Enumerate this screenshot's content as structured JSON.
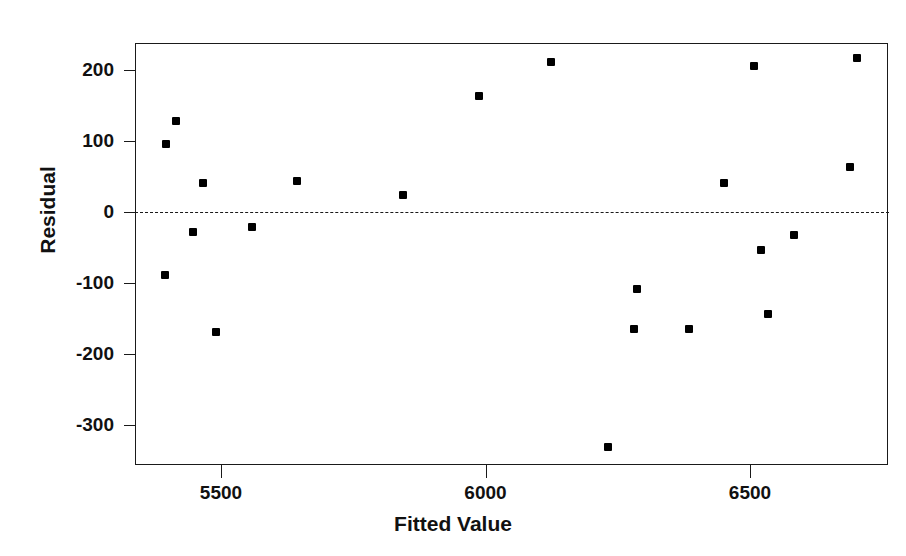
{
  "chart_data": {
    "type": "scatter",
    "title": "",
    "xlabel": "Fitted Value",
    "ylabel": "Residual",
    "xlim": [
      5329,
      6753
    ],
    "ylim": [
      -355,
      238
    ],
    "xticks": [
      5500,
      6000,
      6500
    ],
    "yticks": [
      200,
      100,
      0,
      -100,
      -200,
      -300
    ],
    "xtick_labels": [
      "5500",
      "6000",
      "6500"
    ],
    "ytick_labels": [
      "200",
      "100",
      "0",
      "-100",
      "-200",
      "-300"
    ],
    "grid": false,
    "legend": null,
    "reference_line": {
      "orientation": "horizontal",
      "value": 0,
      "style": "dashed",
      "color": "#1a1a1a"
    },
    "marker": {
      "shape": "square",
      "color": "#000000",
      "size": 8
    },
    "x": [
      5414,
      5396,
      5466,
      5447,
      5559,
      5394,
      5491,
      5644,
      5844,
      5988,
      6124,
      6287,
      6281,
      6385,
      6232,
      6451,
      6508,
      6521,
      6534,
      6583,
      6689,
      6702
    ],
    "y": [
      128,
      96,
      41,
      -28,
      -21,
      -89,
      -169,
      44,
      24,
      163,
      211,
      -108,
      -165,
      -165,
      -331,
      41,
      206,
      -53,
      -144,
      -32,
      63,
      217
    ],
    "points": [
      {
        "x": 5414,
        "y": 128
      },
      {
        "x": 5396,
        "y": 96
      },
      {
        "x": 5466,
        "y": 41
      },
      {
        "x": 5447,
        "y": -28
      },
      {
        "x": 5559,
        "y": -21
      },
      {
        "x": 5394,
        "y": -89
      },
      {
        "x": 5491,
        "y": -169
      },
      {
        "x": 5644,
        "y": 44
      },
      {
        "x": 5844,
        "y": 24
      },
      {
        "x": 5988,
        "y": 163
      },
      {
        "x": 6124,
        "y": 211
      },
      {
        "x": 6287,
        "y": -108
      },
      {
        "x": 6281,
        "y": -165
      },
      {
        "x": 6385,
        "y": -165
      },
      {
        "x": 6232,
        "y": -331
      },
      {
        "x": 6451,
        "y": 41
      },
      {
        "x": 6508,
        "y": 206
      },
      {
        "x": 6521,
        "y": -53
      },
      {
        "x": 6534,
        "y": -144
      },
      {
        "x": 6583,
        "y": -32
      },
      {
        "x": 6689,
        "y": 63
      },
      {
        "x": 6702,
        "y": 217
      }
    ]
  }
}
